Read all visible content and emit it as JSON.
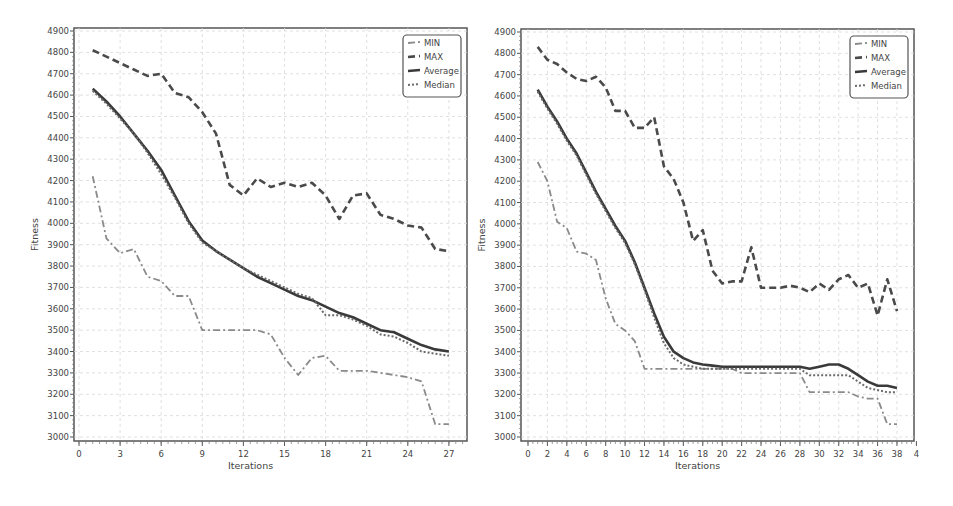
{
  "chart_data": [
    {
      "type": "line",
      "title": "",
      "xlabel": "Iterations",
      "ylabel": "Fitness",
      "xlim": [
        0,
        28
      ],
      "ylim": [
        3000,
        4900
      ],
      "xticks": [
        0,
        3,
        6,
        9,
        12,
        15,
        18,
        21,
        24,
        27
      ],
      "yticks": [
        3000,
        3100,
        3200,
        3300,
        3400,
        3500,
        3600,
        3700,
        3800,
        3900,
        4000,
        4100,
        4200,
        4300,
        4400,
        4500,
        4600,
        4700,
        4800,
        4900
      ],
      "grid": true,
      "legend_position": "upper right",
      "x": [
        1,
        2,
        3,
        4,
        5,
        6,
        7,
        8,
        9,
        10,
        11,
        12,
        13,
        14,
        15,
        16,
        17,
        18,
        19,
        20,
        21,
        22,
        23,
        24,
        25,
        26,
        27
      ],
      "series": [
        {
          "name": "MIN",
          "style": "dashdot",
          "color": "#8a8a8a",
          "values": [
            4220,
            3930,
            3860,
            3880,
            3750,
            3730,
            3660,
            3660,
            3500,
            3500,
            3500,
            3500,
            3500,
            3480,
            3370,
            3290,
            3370,
            3380,
            3310,
            3310,
            3310,
            3300,
            3290,
            3280,
            3260,
            3060,
            3060
          ]
        },
        {
          "name": "MAX",
          "style": "dashed",
          "color": "#4a4a4a",
          "values": [
            4810,
            4780,
            4750,
            4720,
            4690,
            4700,
            4610,
            4590,
            4520,
            4420,
            4180,
            4130,
            4210,
            4170,
            4190,
            4170,
            4190,
            4130,
            4020,
            4130,
            4140,
            4040,
            4020,
            3990,
            3980,
            3880,
            3870
          ]
        },
        {
          "name": "Average",
          "style": "solid",
          "color": "#3a3a3a",
          "values": [
            4630,
            4570,
            4500,
            4420,
            4340,
            4250,
            4130,
            4010,
            3920,
            3870,
            3830,
            3790,
            3750,
            3720,
            3690,
            3660,
            3640,
            3610,
            3580,
            3560,
            3530,
            3500,
            3490,
            3460,
            3430,
            3410,
            3400
          ]
        },
        {
          "name": "Median",
          "style": "dotted",
          "color": "#6a6a6a",
          "values": [
            4620,
            4560,
            4490,
            4420,
            4330,
            4230,
            4120,
            4000,
            3910,
            3870,
            3830,
            3790,
            3760,
            3730,
            3700,
            3670,
            3650,
            3570,
            3570,
            3550,
            3520,
            3480,
            3470,
            3440,
            3400,
            3390,
            3380
          ]
        }
      ]
    },
    {
      "type": "line",
      "title": "",
      "xlabel": "Iterations",
      "ylabel": "Fitness",
      "xlim": [
        0,
        40
      ],
      "ylim": [
        3000,
        4900
      ],
      "xticks": [
        0,
        2,
        4,
        6,
        8,
        10,
        12,
        14,
        16,
        18,
        20,
        22,
        24,
        26,
        28,
        30,
        32,
        34,
        36,
        38,
        40
      ],
      "xtick_labels": [
        "0",
        "2",
        "4",
        "6",
        "8",
        "10",
        "12",
        "14",
        "16",
        "18",
        "20",
        "22",
        "24",
        "26",
        "28",
        "30",
        "32",
        "34",
        "36",
        "38",
        "4"
      ],
      "yticks": [
        3000,
        3100,
        3200,
        3300,
        3400,
        3500,
        3600,
        3700,
        3800,
        3900,
        4000,
        4100,
        4200,
        4300,
        4400,
        4500,
        4600,
        4700,
        4800,
        4900
      ],
      "grid": true,
      "legend_position": "upper right",
      "x": [
        1,
        2,
        3,
        4,
        5,
        6,
        7,
        8,
        9,
        10,
        11,
        12,
        13,
        14,
        15,
        16,
        17,
        18,
        19,
        20,
        21,
        22,
        23,
        24,
        25,
        26,
        27,
        28,
        29,
        30,
        31,
        32,
        33,
        34,
        35,
        36,
        37,
        38
      ],
      "series": [
        {
          "name": "MIN",
          "style": "dashdot",
          "color": "#8a8a8a",
          "values": [
            4290,
            4200,
            4010,
            3980,
            3870,
            3860,
            3830,
            3650,
            3530,
            3500,
            3450,
            3320,
            3320,
            3320,
            3320,
            3320,
            3320,
            3320,
            3320,
            3320,
            3320,
            3300,
            3300,
            3300,
            3300,
            3300,
            3300,
            3300,
            3210,
            3210,
            3210,
            3210,
            3210,
            3190,
            3180,
            3180,
            3060,
            3060
          ]
        },
        {
          "name": "MAX",
          "style": "dashed",
          "color": "#4a4a4a",
          "values": [
            4830,
            4770,
            4750,
            4710,
            4680,
            4670,
            4690,
            4640,
            4530,
            4530,
            4450,
            4450,
            4500,
            4270,
            4210,
            4100,
            3920,
            3970,
            3780,
            3720,
            3730,
            3730,
            3890,
            3700,
            3700,
            3700,
            3710,
            3700,
            3680,
            3720,
            3690,
            3740,
            3760,
            3700,
            3720,
            3570,
            3740,
            3590
          ]
        },
        {
          "name": "Average",
          "style": "solid",
          "color": "#3a3a3a",
          "values": [
            4630,
            4550,
            4480,
            4400,
            4330,
            4240,
            4150,
            4070,
            3990,
            3920,
            3820,
            3700,
            3580,
            3470,
            3400,
            3370,
            3350,
            3340,
            3335,
            3330,
            3330,
            3330,
            3330,
            3330,
            3330,
            3330,
            3330,
            3330,
            3320,
            3330,
            3340,
            3340,
            3320,
            3290,
            3260,
            3240,
            3240,
            3230
          ]
        },
        {
          "name": "Median",
          "style": "dotted",
          "color": "#6a6a6a",
          "values": [
            4620,
            4540,
            4470,
            4390,
            4320,
            4230,
            4140,
            4060,
            3980,
            3910,
            3810,
            3690,
            3560,
            3440,
            3370,
            3340,
            3330,
            3320,
            3320,
            3320,
            3320,
            3320,
            3320,
            3320,
            3320,
            3320,
            3320,
            3320,
            3290,
            3290,
            3290,
            3290,
            3290,
            3260,
            3230,
            3220,
            3210,
            3210
          ]
        }
      ]
    }
  ],
  "charts": [
    {
      "xlabel": "Iterations",
      "ylabel": "Fitness",
      "legend": [
        "MIN",
        "MAX",
        "Average",
        "Median"
      ]
    },
    {
      "xlabel": "Iterations",
      "ylabel": "Fitness",
      "legend": [
        "MIN",
        "MAX",
        "Average",
        "Median"
      ]
    }
  ]
}
